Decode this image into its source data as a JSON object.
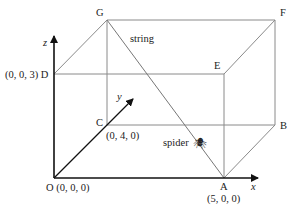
{
  "diagram": {
    "type": "3d-cuboid-spider-string",
    "vertices": {
      "O": {
        "label": "O (0, 0, 0)",
        "coords": "(0, 0, 0)"
      },
      "A": {
        "label": "A",
        "coords": "(5, 0, 0)"
      },
      "B": {
        "label": "B"
      },
      "C": {
        "label": "C",
        "coords": "(0, 4, 0)"
      },
      "D": {
        "label": "(0, 0, 3) D",
        "coords": "(0, 0, 3)"
      },
      "E": {
        "label": "E"
      },
      "F": {
        "label": "F"
      },
      "G": {
        "label": "G"
      }
    },
    "axes": {
      "x": "x",
      "y": "y",
      "z": "z"
    },
    "annotations": {
      "string": "string",
      "spider": "spider",
      "spider_icon": "🕷"
    },
    "colors": {
      "edges": "#8a8a8a",
      "axes": "#111111",
      "text": "#222222"
    }
  }
}
